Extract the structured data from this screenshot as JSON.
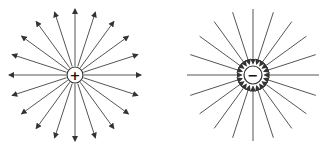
{
  "diagram": {
    "charges": [
      {
        "name": "positive-charge",
        "sign": "+",
        "cx": 75,
        "cy": 75,
        "r": 8,
        "lines": 20,
        "inner": 9,
        "outer": 66,
        "direction": "outward"
      },
      {
        "name": "negative-charge",
        "sign": "−",
        "cx": 253,
        "cy": 75,
        "r": 9,
        "lines": 20,
        "inner": 10,
        "outer": 66,
        "direction": "inward"
      }
    ],
    "colors": {
      "line": "#555555",
      "arrow": "#333333",
      "circle": "#333333",
      "background": "#ffffff"
    }
  }
}
